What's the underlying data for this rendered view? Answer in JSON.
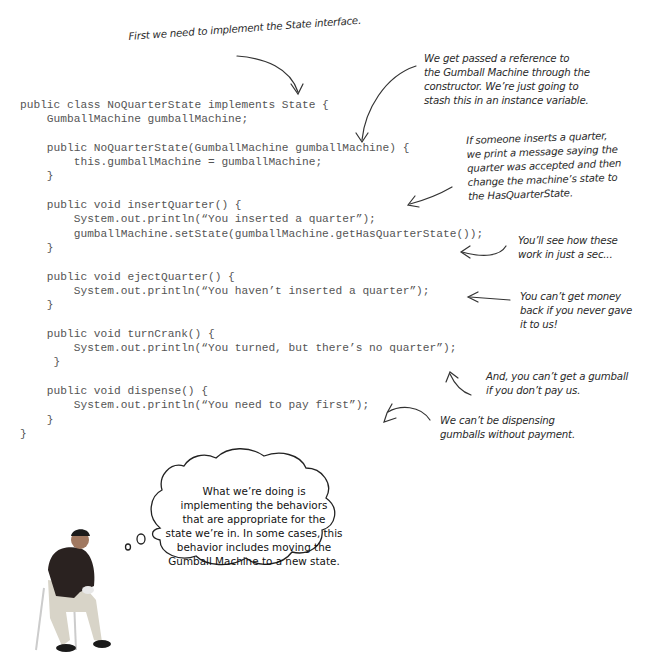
{
  "code": {
    "language": "java",
    "lines": [
      "public class NoQuarterState implements State {",
      "    GumballMachine gumballMachine;",
      "",
      "    public NoQuarterState(GumballMachine gumballMachine) {",
      "        this.gumballMachine = gumballMachine;",
      "    }",
      "",
      "    public void insertQuarter() {",
      "        System.out.println(“You inserted a quarter”);",
      "        gumballMachine.setState(gumballMachine.getHasQuarterState());",
      "    }",
      "",
      "    public void ejectQuarter() {",
      "        System.out.println(“You haven’t inserted a quarter”);",
      "    }",
      "",
      "    public void turnCrank() {",
      "        System.out.println(“You turned, but there’s no quarter”);",
      "     }",
      "",
      "    public void dispense() {",
      "        System.out.println(“You need to pay first”);",
      "    }",
      "}"
    ]
  },
  "annotations": {
    "state_interface": {
      "lines": [
        "First we need to implement the State interface."
      ]
    },
    "constructor_reference": {
      "lines": [
        "We get passed a reference to",
        "the Gumball Machine through the",
        "constructor.  We’re just going to",
        "stash this in an instance variable."
      ]
    },
    "insert_quarter": {
      "lines": [
        "If someone inserts a quarter,",
        "we print a message saying the",
        "quarter was accepted and then",
        "change the machine’s state to",
        "the HasQuarterState."
      ]
    },
    "see_how": {
      "lines": [
        "You’ll see how these",
        "work in just a sec..."
      ]
    },
    "eject_quarter": {
      "lines": [
        "You can’t get money",
        "back if you never gave",
        "it to us!"
      ]
    },
    "turn_crank": {
      "lines": [
        "And, you can’t get a gumball",
        "if you don’t pay us."
      ]
    },
    "dispense": {
      "lines": [
        "We can’t be dispensing",
        "gumballs without payment."
      ]
    }
  },
  "thought_bubble": {
    "lines": [
      "What we’re doing is",
      "implementing the behaviors",
      "that are appropriate for the",
      "state we’re in.  In some cases, this",
      "behavior includes moving the",
      "Gumball Machine to a new state."
    ]
  },
  "colors": {
    "code_text": "#555555",
    "annotation_text": "#2a2a2a",
    "arrow": "#333333",
    "background": "#ffffff"
  }
}
